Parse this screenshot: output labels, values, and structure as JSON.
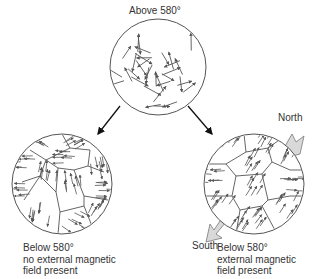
{
  "diagram": {
    "top": {
      "label": "Above 580°",
      "state": "random"
    },
    "bottom_left": {
      "caption_lines": [
        "Below 580°",
        "no external magnetic",
        "field present"
      ],
      "state": "domains-random"
    },
    "bottom_right": {
      "caption_lines": [
        "Below 580°",
        "external magnetic",
        "field present"
      ],
      "state": "domains-aligned",
      "north_label": "North",
      "south_label": "South"
    },
    "colors": {
      "line": "#555555",
      "arrow": "#555555",
      "field_arrow_fill": "#d9d9d9"
    }
  }
}
